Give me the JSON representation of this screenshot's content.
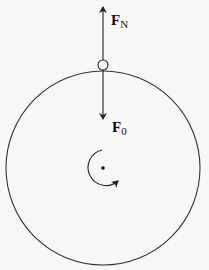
{
  "diagram": {
    "labels": {
      "force_up": {
        "main": "F",
        "sub": "N"
      },
      "force_down": {
        "main": "F",
        "sub": "0"
      }
    },
    "elements": {
      "disk": {
        "cx": 103,
        "cy": 168,
        "r": 97
      },
      "ball": {
        "cx": 103,
        "cy": 65,
        "r": 5
      },
      "center_dot": {
        "cx": 103,
        "cy": 168,
        "r": 1.6
      },
      "rotation": "clockwise"
    },
    "colors": {
      "line": "#222222",
      "background": "#f7f7f5"
    }
  }
}
